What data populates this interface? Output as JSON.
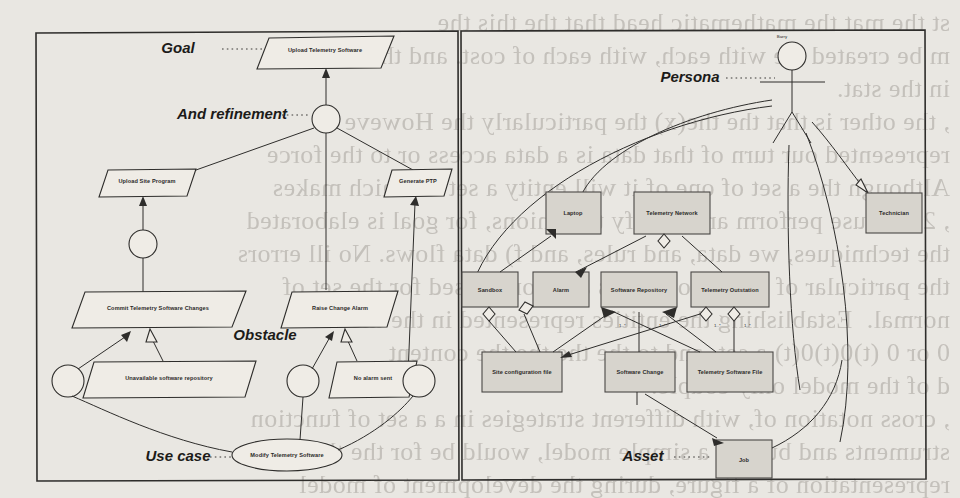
{
  "figure": {
    "background_text": "st the mat the mathematic head that the this the\nm be created we with each, with each of cost. and the the\nin the stat.\n, the other is that the the(x) the particularly the Howeve\nrepresented our turn of that data is a data access or to the force\nAlthough the a set of one of it will entity a set at which makes\n, 2 because perform an identify the onions, for goal is elaborated\nthe techniques, we data, and rules, and f) data flows. No ill errors\nthe particular of the set of errors and formalised for the set of\nnormal.  Establishing the entities represented in the the set\n0 or 0 (t)0(t)0(t) a set, and to the the the the content\nd of the model only couple.\n, cross notation of, with different strategies in a a set of function\nstruments and but the a simple model, would be for the the\nrepresentation of a figure, during the development of model",
    "left_panel": {
      "name": "goal-model-panel",
      "annotations": [
        {
          "key": "goal",
          "label": "Goal"
        },
        {
          "key": "and_refinement",
          "label": "And refinement"
        },
        {
          "key": "obstacle",
          "label": "Obstacle"
        },
        {
          "key": "use_case",
          "label": "Use case"
        }
      ],
      "goals": [
        {
          "id": "upload-telemetry-software",
          "label": "Upload Telemetry Software"
        },
        {
          "id": "upload-site-program",
          "label": "Upload Site Program"
        },
        {
          "id": "generate-ptp",
          "label": "Generate PTP"
        },
        {
          "id": "commit-telemetry-software-changes",
          "label": "Commit Telemetry Software Changes"
        },
        {
          "id": "raise-change-alarm",
          "label": "Raise Change Alarm"
        }
      ],
      "obstacles": [
        {
          "id": "unavailable-software-repository",
          "label": "Unavailable software repository"
        },
        {
          "id": "no-alarm-sent",
          "label": "No alarm sent"
        }
      ],
      "use_cases": [
        {
          "id": "modify-telemetry-software",
          "label": "Modify Telemetry Software"
        }
      ]
    },
    "right_panel": {
      "name": "asset-model-panel",
      "annotations": [
        {
          "key": "persona",
          "label": "Persona"
        },
        {
          "key": "asset",
          "label": "Asset"
        }
      ],
      "persona": {
        "id": "barry",
        "label": "Barry"
      },
      "assets": [
        {
          "id": "laptop",
          "label": "Laptop"
        },
        {
          "id": "telemetry-network",
          "label": "Telemetry Network"
        },
        {
          "id": "technician",
          "label": "Technician"
        },
        {
          "id": "sandbox",
          "label": "Sandbox"
        },
        {
          "id": "alarm",
          "label": "Alarm"
        },
        {
          "id": "software-repository",
          "label": "Software Repository"
        },
        {
          "id": "telemetry-outstation",
          "label": "Telemetry Outstation"
        },
        {
          "id": "site-configuration-file",
          "label": "Site configuration file"
        },
        {
          "id": "software-change",
          "label": "Software Change"
        },
        {
          "id": "telemetry-software-file",
          "label": "Telemetry Software File"
        },
        {
          "id": "job",
          "label": "Job"
        }
      ],
      "multiplicities": [
        "1..*",
        "1..*",
        "1..*",
        "1..*"
      ]
    },
    "colors": {
      "paper": "#e9e7e2",
      "ink": "#2e2d2b",
      "asset_fill": "#d7d4cd",
      "bleed_text": "#78746c"
    }
  }
}
